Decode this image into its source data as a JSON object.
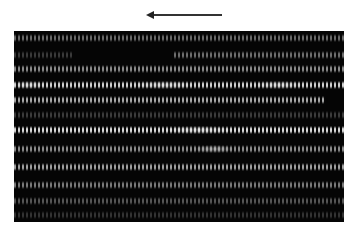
{
  "figure": {
    "type": "grayscale micrograph",
    "arrow": {
      "direction": "left",
      "color": "#222222"
    },
    "panel": {
      "background": "#050505",
      "stripe_period_px": 4
    },
    "bands": [
      {
        "top": 3,
        "left": 0,
        "width": 330,
        "color": "#6a6a6a"
      },
      {
        "top": 20,
        "left": 0,
        "width": 60,
        "color": "#3a3a3a"
      },
      {
        "top": 20,
        "left": 160,
        "width": 170,
        "color": "#6e6e6e"
      },
      {
        "top": 34,
        "left": 0,
        "width": 330,
        "color": "#8a8a8a"
      },
      {
        "top": 50,
        "left": 0,
        "width": 330,
        "color": "#cfcfcf"
      },
      {
        "top": 65,
        "left": 0,
        "width": 310,
        "color": "#a8a8a8"
      },
      {
        "top": 80,
        "left": 0,
        "width": 330,
        "color": "#3c3c3c"
      },
      {
        "top": 95,
        "left": 0,
        "width": 330,
        "color": "#d8d8d8"
      },
      {
        "top": 114,
        "left": 0,
        "width": 330,
        "color": "#8c8c8c"
      },
      {
        "top": 132,
        "left": 0,
        "width": 330,
        "color": "#a0a0a0"
      },
      {
        "top": 150,
        "left": 0,
        "width": 330,
        "color": "#7a7a7a"
      },
      {
        "top": 166,
        "left": 0,
        "width": 330,
        "color": "#555555"
      },
      {
        "top": 180,
        "left": 0,
        "width": 330,
        "color": "#333333"
      }
    ],
    "highlights": [
      {
        "top": 50,
        "left": 0,
        "width": 30
      },
      {
        "top": 50,
        "left": 120,
        "width": 60
      },
      {
        "top": 50,
        "left": 240,
        "width": 50
      },
      {
        "top": 95,
        "left": 150,
        "width": 70
      },
      {
        "top": 114,
        "left": 180,
        "width": 40
      }
    ]
  }
}
